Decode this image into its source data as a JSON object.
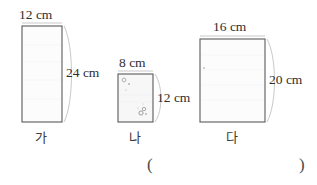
{
  "figure": {
    "type": "geometry-rectangles-comparison",
    "background_color": "#ffffff",
    "stroke_color": "#555555",
    "brace_color": "#bbbbbb",
    "fill_color": "#fbfbfb",
    "speckle_color": "#b0b0b0",
    "shapes": [
      {
        "id": "rect-ga",
        "name_label": "가",
        "width_label": "12 cm",
        "height_label": "24 cm",
        "width_cm": 12,
        "height_cm": 24,
        "area_cm2": 288
      },
      {
        "id": "rect-na",
        "name_label": "나",
        "width_label": "8 cm",
        "height_label": "12 cm",
        "width_cm": 8,
        "height_cm": 12,
        "area_cm2": 96
      },
      {
        "id": "rect-da",
        "name_label": "다",
        "width_label": "16 cm",
        "height_label": "20 cm",
        "width_cm": 16,
        "height_cm": 20,
        "area_cm2": 320
      }
    ],
    "answer_blank": {
      "open_paren": "(",
      "close_paren": ")",
      "value": ""
    }
  }
}
